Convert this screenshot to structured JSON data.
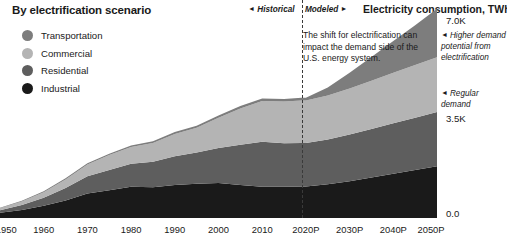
{
  "header": {
    "panel_title": "By electrification scenario",
    "segment_historical": "Historical",
    "segment_modeled": "Modeled",
    "axis_unit_title": "Electricity consumption, TWh",
    "caret_left": "◄",
    "caret_right": "►"
  },
  "legend": {
    "items": [
      {
        "label": "Transportation",
        "color": "#7d7d7d"
      },
      {
        "label": "Commercial",
        "color": "#b4b4b4"
      },
      {
        "label": "Residential",
        "color": "#5e5e5e"
      },
      {
        "label": "Industrial",
        "color": "#1a1a1a"
      }
    ]
  },
  "annotations": {
    "callout_shift": "The shift for electrification can impact the demand side of the U.S. energy system.",
    "higher_demand": "Higher demand potential from electrification",
    "regular_demand": "Regular demand",
    "caret": "◄"
  },
  "yaxis": {
    "ticks": [
      "7.0K",
      "3.5K",
      "0.0"
    ]
  },
  "chart_data": {
    "type": "area",
    "title": "Electricity consumption, TWh",
    "subtitle": "By electrification scenario",
    "xlabel": "",
    "ylabel": "Electricity consumption, TWh",
    "ylim": [
      0,
      7000
    ],
    "xlim": [
      1950,
      2050
    ],
    "grid": false,
    "legend_position": "top-left",
    "stacked": true,
    "forecast_start": 2019,
    "forecast_divider_label": "Modeled",
    "history_label": "Historical",
    "x_tick_labels": [
      "1950",
      "1960",
      "1970",
      "1980",
      "1990",
      "2000",
      "2010",
      "2020P",
      "2030P",
      "2040P",
      "2050P"
    ],
    "y_tick_labels": [
      "0.0",
      "3.5K",
      "7.0K"
    ],
    "x": [
      1950,
      1955,
      1960,
      1965,
      1970,
      1975,
      1980,
      1985,
      1990,
      1995,
      2000,
      2005,
      2010,
      2015,
      2019,
      2020,
      2025,
      2030,
      2035,
      2040,
      2045,
      2050
    ],
    "series": [
      {
        "name": "Industrial",
        "color": "#1a1a1a",
        "values": [
          170,
          260,
          390,
          560,
          790,
          890,
          1000,
          990,
          1060,
          1100,
          1120,
          1060,
          1000,
          1000,
          1010,
          1010,
          1080,
          1180,
          1300,
          1420,
          1540,
          1660
        ]
      },
      {
        "name": "Residential",
        "color": "#5e5e5e",
        "values": [
          80,
          160,
          260,
          400,
          550,
          650,
          740,
          820,
          920,
          1000,
          1130,
          1290,
          1450,
          1400,
          1400,
          1400,
          1440,
          1500,
          1560,
          1620,
          1680,
          1740
        ]
      },
      {
        "name": "Commercial",
        "color": "#b4b4b4",
        "values": [
          60,
          110,
          180,
          280,
          380,
          480,
          540,
          600,
          720,
          800,
          970,
          1170,
          1310,
          1340,
          1360,
          1360,
          1410,
          1480,
          1550,
          1620,
          1690,
          1760
        ]
      },
      {
        "name": "Transportation",
        "color": "#7d7d7d",
        "values": [
          20,
          25,
          30,
          35,
          40,
          45,
          50,
          55,
          60,
          65,
          70,
          75,
          80,
          85,
          90,
          95,
          260,
          500,
          760,
          1020,
          1280,
          1560
        ]
      }
    ],
    "annotation_points": [
      {
        "label": "Regular demand",
        "x": 2050,
        "y": 3900
      },
      {
        "label": "Higher demand potential from electrification",
        "x": 2050,
        "y": 6100
      }
    ]
  }
}
